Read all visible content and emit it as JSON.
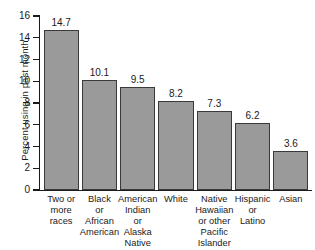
{
  "chart_data": {
    "type": "bar",
    "title": "",
    "xlabel": "",
    "ylabel": "Percent using in past month",
    "ylim": [
      0,
      16
    ],
    "ytick_step": 2,
    "yticks": [
      16,
      14,
      12,
      10,
      8,
      6,
      4,
      2,
      0
    ],
    "ytick_labels": [
      "16",
      "14",
      "12",
      "10",
      "8",
      "6",
      "4",
      "2",
      "0"
    ],
    "grid": false,
    "legend": null,
    "bar_color": "#9a9a9a",
    "bar_edge_color": "#3a3a3a",
    "categories": [
      "Two or more races",
      "Black or African American",
      "American Indian or Alaska Native",
      "White",
      "Native Hawaiian or other Pacific Islander",
      "Hispanic or Latino",
      "Asian"
    ],
    "category_label_lines": [
      [
        "Two or",
        "more",
        "races"
      ],
      [
        "Black",
        "or",
        "African",
        "American"
      ],
      [
        "American",
        "Indian",
        "or",
        "Alaska",
        "Native"
      ],
      [
        "White"
      ],
      [
        "Native",
        "Hawaiian",
        "or other",
        "Pacific",
        "Islander"
      ],
      [
        "Hispanic",
        "or",
        "Latino"
      ],
      [
        "Asian"
      ]
    ],
    "values": [
      14.7,
      10.1,
      9.5,
      8.2,
      7.3,
      6.2,
      3.6
    ],
    "value_labels": [
      "14.7",
      "10.1",
      "9.5",
      "8.2",
      "7.3",
      "6.2",
      "3.6"
    ]
  }
}
